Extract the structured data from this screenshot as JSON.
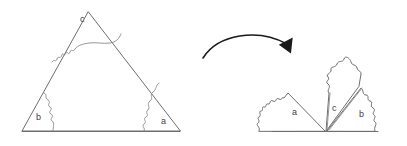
{
  "figure": {
    "background_color": "#ffffff",
    "line_color": "#6e6e6e",
    "arrow_color": "#1a1a1a",
    "label_color": "#3d3d3d",
    "width": 407,
    "height": 146
  },
  "left_shape": {
    "name": "triangle-with-torn-angle-pieces",
    "labels": {
      "corner_c": "c",
      "corner_b": "b",
      "corner_a": "a"
    },
    "vertices": {
      "apex": [
        88,
        12
      ],
      "bottom_left": [
        22,
        131
      ],
      "bottom_right": [
        180,
        131
      ]
    }
  },
  "arrow": {
    "name": "transformation-arrow",
    "direction": "left-to-right-curved"
  },
  "right_shape": {
    "name": "reassembled-angles-on-straight-line",
    "labels": {
      "piece_a": "a",
      "piece_c": "c",
      "piece_b": "b"
    },
    "baseline": {
      "start_x": 272,
      "end_x": 378,
      "y": 131
    }
  }
}
